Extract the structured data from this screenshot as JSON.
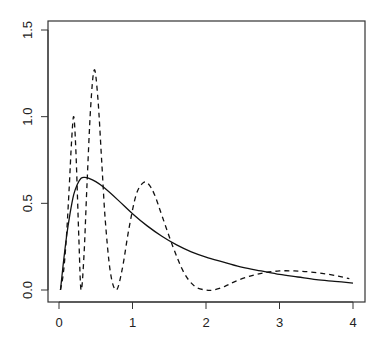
{
  "chart_data": {
    "type": "line",
    "title": "",
    "xlabel": "",
    "ylabel": "",
    "xlim": [
      0,
      4
    ],
    "ylim": [
      0,
      1.5
    ],
    "grid": false,
    "legend": null,
    "x_ticks": [
      "0",
      "1",
      "2",
      "3",
      "4"
    ],
    "y_ticks": [
      "0.0",
      "0.5",
      "1.0",
      "1.5"
    ],
    "series": [
      {
        "name": "solid curve",
        "style": "solid",
        "color": "#111111",
        "x": [
          0.02,
          0.05,
          0.1,
          0.15,
          0.2,
          0.25,
          0.3,
          0.35,
          0.4,
          0.5,
          0.6,
          0.8,
          1.0,
          1.2,
          1.4,
          1.6,
          1.8,
          2.0,
          2.25,
          2.5,
          2.75,
          3.0,
          3.25,
          3.5,
          3.75,
          4.0
        ],
        "y": [
          0.0,
          0.12,
          0.3,
          0.44,
          0.55,
          0.61,
          0.645,
          0.65,
          0.645,
          0.625,
          0.595,
          0.52,
          0.44,
          0.37,
          0.31,
          0.26,
          0.22,
          0.19,
          0.16,
          0.13,
          0.11,
          0.09,
          0.075,
          0.06,
          0.05,
          0.04
        ]
      },
      {
        "name": "dashed curve",
        "style": "dashed",
        "color": "#111111",
        "x": [
          0.02,
          0.06,
          0.1,
          0.14,
          0.17,
          0.2,
          0.23,
          0.27,
          0.3,
          0.34,
          0.38,
          0.43,
          0.48,
          0.53,
          0.58,
          0.63,
          0.7,
          0.78,
          0.86,
          0.95,
          1.05,
          1.15,
          1.22,
          1.3,
          1.4,
          1.55,
          1.7,
          1.85,
          2.0,
          2.1,
          2.25,
          2.4,
          2.6,
          2.8,
          3.0,
          3.2,
          3.4,
          3.6,
          3.8,
          3.95
        ],
        "y": [
          0.0,
          0.1,
          0.3,
          0.6,
          0.85,
          1.0,
          0.8,
          0.3,
          0.0,
          0.2,
          0.6,
          1.05,
          1.27,
          1.1,
          0.75,
          0.4,
          0.1,
          0.0,
          0.12,
          0.35,
          0.55,
          0.62,
          0.61,
          0.55,
          0.43,
          0.25,
          0.1,
          0.02,
          0.0,
          0.0,
          0.02,
          0.05,
          0.08,
          0.1,
          0.11,
          0.11,
          0.105,
          0.095,
          0.08,
          0.065
        ]
      }
    ]
  },
  "layout": {
    "plot_box": {
      "left": 48,
      "top": 21,
      "right": 365,
      "bottom": 302
    },
    "x_map": {
      "v0": 0,
      "px0": 59,
      "v1": 4,
      "px1": 353
    },
    "y_map": {
      "v0": 0,
      "px0": 290,
      "v1": 1.5,
      "px1": 30
    }
  }
}
